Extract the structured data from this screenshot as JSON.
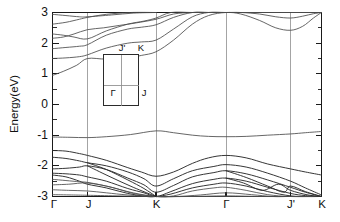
{
  "chart_data": {
    "type": "line",
    "title": "",
    "xlabel": "",
    "ylabel": "Energy(eV)",
    "ylim": [
      -3,
      3
    ],
    "grid": false,
    "legend": "none",
    "y_ticks": [
      3,
      2,
      1,
      0,
      -1,
      -2,
      -3
    ],
    "y_tick_labels": [
      "3",
      "2",
      "1",
      "0",
      "-1",
      "-2",
      "-3"
    ],
    "y_minor_step": 0.5,
    "x_tick_labels": [
      "Γ",
      "J",
      "K",
      "Γ",
      "J'",
      "K"
    ],
    "x_tick_positions": [
      0.0,
      0.13,
      0.385,
      0.645,
      0.885,
      1.0
    ],
    "high_symmetry_lines": [
      0.13,
      0.385,
      0.645,
      0.885
    ],
    "path_description": "Γ - J - K - Γ - J' - K",
    "series": [
      {
        "name": "conduction-band-1",
        "x": [
          0.0,
          0.04,
          0.09,
          0.13,
          0.2,
          0.28,
          0.33,
          0.385,
          0.45,
          0.52,
          0.58,
          0.645,
          0.7,
          0.77,
          0.83,
          0.885,
          0.93,
          0.97,
          1.0
        ],
        "y": [
          0.95,
          1.08,
          1.28,
          1.5,
          1.48,
          1.52,
          1.6,
          1.72,
          2.1,
          2.62,
          2.9,
          3.0,
          2.95,
          2.74,
          2.5,
          2.42,
          2.55,
          2.82,
          3.0
        ]
      },
      {
        "name": "conduction-band-2",
        "x": [
          0.0,
          0.05,
          0.1,
          0.13,
          0.2,
          0.28,
          0.33,
          0.385,
          0.45,
          0.52,
          0.58,
          0.645,
          0.7,
          0.77,
          0.83,
          0.885,
          0.93,
          0.97,
          1.0
        ],
        "y": [
          1.5,
          1.52,
          1.56,
          1.62,
          1.84,
          2.0,
          2.04,
          2.1,
          2.46,
          2.86,
          3.0,
          3.0,
          3.0,
          2.95,
          2.86,
          2.82,
          2.88,
          2.96,
          3.0
        ]
      },
      {
        "name": "conduction-band-3",
        "x": [
          0.0,
          0.05,
          0.1,
          0.13,
          0.2,
          0.28,
          0.33,
          0.385,
          0.45,
          0.52,
          0.58,
          0.645,
          0.72,
          0.8,
          0.885,
          0.94,
          1.0
        ],
        "y": [
          1.82,
          1.86,
          1.9,
          1.95,
          2.26,
          2.46,
          2.52,
          2.6,
          2.84,
          3.0,
          3.0,
          3.0,
          3.0,
          3.0,
          3.0,
          3.0,
          3.0
        ]
      },
      {
        "name": "conduction-band-4",
        "x": [
          0.0,
          0.04,
          0.08,
          0.13,
          0.19,
          0.25,
          0.31,
          0.385,
          0.45,
          0.52,
          0.6,
          0.645,
          0.72,
          0.8,
          0.885,
          0.94,
          1.0
        ],
        "y": [
          2.16,
          2.2,
          2.3,
          2.44,
          2.5,
          2.58,
          2.66,
          2.78,
          2.95,
          3.0,
          3.0,
          3.0,
          3.0,
          3.0,
          3.0,
          3.0,
          3.0
        ]
      },
      {
        "name": "conduction-band-5",
        "x": [
          0.0,
          0.04,
          0.08,
          0.13,
          0.2,
          0.28,
          0.34,
          0.385,
          0.44,
          0.52,
          0.6,
          0.645,
          0.73,
          0.81,
          0.885,
          0.95,
          1.0
        ],
        "y": [
          2.3,
          2.26,
          2.2,
          2.14,
          2.4,
          2.62,
          2.72,
          2.82,
          3.0,
          3.0,
          3.0,
          3.0,
          3.0,
          3.0,
          3.0,
          3.0,
          3.0
        ]
      },
      {
        "name": "conduction-band-6",
        "x": [
          0.0,
          0.05,
          0.1,
          0.13,
          0.2,
          0.29,
          0.385
        ],
        "y": [
          2.62,
          2.68,
          2.78,
          2.84,
          2.94,
          3.0,
          3.0
        ]
      },
      {
        "name": "conduction-band-7",
        "x": [
          0.0,
          0.05,
          0.1,
          0.13,
          0.22,
          0.3,
          0.385
        ],
        "y": [
          2.94,
          2.9,
          2.86,
          2.86,
          2.92,
          2.98,
          3.0
        ]
      },
      {
        "name": "flat-band-upper",
        "x": [
          0.0,
          0.065,
          0.13,
          0.2,
          0.29,
          0.385,
          0.45,
          0.52,
          0.58,
          0.645,
          0.72,
          0.8,
          0.885,
          0.94,
          1.0
        ],
        "y": [
          -1.06,
          -1.07,
          -1.08,
          -1.05,
          -0.98,
          -0.86,
          -0.92,
          -1.0,
          -1.04,
          -1.05,
          -1.04,
          -1.0,
          -0.96,
          -0.92,
          -0.88
        ]
      },
      {
        "name": "valence-band-1",
        "x": [
          0.0,
          0.05,
          0.1,
          0.13,
          0.2,
          0.28,
          0.33,
          0.385,
          0.45,
          0.52,
          0.58,
          0.645,
          0.72,
          0.8,
          0.885,
          0.94,
          1.0
        ],
        "y": [
          -1.5,
          -1.52,
          -1.6,
          -1.66,
          -1.82,
          -2.06,
          -2.2,
          -2.34,
          -2.2,
          -1.92,
          -1.74,
          -1.66,
          -1.74,
          -1.94,
          -2.1,
          -2.2,
          -2.3
        ]
      },
      {
        "name": "valence-band-2",
        "x": [
          0.0,
          0.05,
          0.1,
          0.13,
          0.2,
          0.28,
          0.34,
          0.385,
          0.45,
          0.52,
          0.6,
          0.645,
          0.72,
          0.8,
          0.885,
          0.94,
          1.0
        ],
        "y": [
          -1.72,
          -1.76,
          -1.84,
          -1.9,
          -2.0,
          -2.2,
          -2.42,
          -2.66,
          -2.42,
          -2.16,
          -2.02,
          -1.96,
          -2.04,
          -2.24,
          -2.5,
          -2.72,
          -2.95
        ]
      },
      {
        "name": "valence-band-3",
        "x": [
          0.0,
          0.05,
          0.1,
          0.13,
          0.2,
          0.28,
          0.34,
          0.385,
          0.45,
          0.52,
          0.6,
          0.645,
          0.72,
          0.8,
          0.885,
          0.94,
          1.0
        ],
        "y": [
          -2.1,
          -2.08,
          -2.04,
          -2.0,
          -2.12,
          -2.4,
          -2.62,
          -2.86,
          -2.64,
          -2.36,
          -2.22,
          -2.16,
          -2.26,
          -2.46,
          -2.7,
          -2.86,
          -3.0
        ]
      },
      {
        "name": "valence-band-4",
        "x": [
          0.0,
          0.05,
          0.1,
          0.13,
          0.2,
          0.28,
          0.34,
          0.385,
          0.44,
          0.52,
          0.6,
          0.645,
          0.72,
          0.8,
          0.885,
          0.94,
          1.0
        ],
        "y": [
          -2.24,
          -2.26,
          -2.3,
          -2.36,
          -2.5,
          -2.74,
          -2.88,
          -3.0,
          -2.84,
          -2.58,
          -2.44,
          -2.4,
          -2.5,
          -2.7,
          -2.9,
          -2.97,
          -3.0
        ]
      },
      {
        "name": "valence-band-5",
        "x": [
          0.0,
          0.05,
          0.1,
          0.13,
          0.2,
          0.28,
          0.35,
          0.385,
          0.44,
          0.52,
          0.6,
          0.645,
          0.72,
          0.8,
          0.885,
          0.95,
          1.0
        ],
        "y": [
          -2.3,
          -2.36,
          -2.5,
          -2.6,
          -2.72,
          -2.9,
          -3.0,
          -3.0,
          -2.92,
          -2.72,
          -2.6,
          -2.56,
          -2.66,
          -2.84,
          -2.98,
          -3.0,
          -3.0
        ]
      },
      {
        "name": "valence-band-6",
        "x": [
          0.0,
          0.05,
          0.1,
          0.13,
          0.2,
          0.3,
          0.385,
          0.45,
          0.52,
          0.6,
          0.645,
          0.72,
          0.8,
          0.885,
          1.0
        ],
        "y": [
          -2.44,
          -2.48,
          -2.52,
          -2.54,
          -2.66,
          -2.88,
          -3.0,
          -2.98,
          -2.82,
          -2.72,
          -2.7,
          -2.8,
          -2.94,
          -3.0,
          -3.0
        ]
      },
      {
        "name": "valence-band-7",
        "x": [
          0.0,
          0.06,
          0.13,
          0.22,
          0.3,
          0.385,
          0.46,
          0.55,
          0.645,
          0.74,
          0.82,
          0.885,
          1.0
        ],
        "y": [
          -2.62,
          -2.6,
          -2.56,
          -2.7,
          -2.9,
          -3.0,
          -3.0,
          -2.95,
          -2.88,
          -2.94,
          -3.0,
          -3.0,
          -3.0
        ]
      },
      {
        "name": "valence-band-8",
        "x": [
          0.0,
          0.06,
          0.13,
          0.2,
          0.28,
          0.385,
          0.5,
          0.645,
          0.78,
          0.885,
          1.0
        ],
        "y": [
          -2.78,
          -2.8,
          -2.82,
          -2.88,
          -2.95,
          -3.0,
          -3.0,
          -2.98,
          -3.0,
          -3.0,
          -3.0
        ]
      },
      {
        "name": "valence-band-9",
        "x": [
          0.0,
          0.07,
          0.13,
          0.24,
          0.385,
          0.5,
          0.645,
          0.8,
          0.885,
          1.0
        ],
        "y": [
          -2.94,
          -2.95,
          -2.96,
          -2.98,
          -3.0,
          -3.0,
          -3.0,
          -3.0,
          -3.0,
          -3.0
        ]
      },
      {
        "name": "valence-crossing-a",
        "x": [
          0.13,
          0.2,
          0.28,
          0.34,
          0.385
        ],
        "y": [
          -1.9,
          -2.12,
          -2.46,
          -2.74,
          -3.0
        ]
      },
      {
        "name": "valence-crossing-b",
        "x": [
          0.13,
          0.21,
          0.3,
          0.385
        ],
        "y": [
          -2.0,
          -2.34,
          -2.7,
          -3.0
        ]
      },
      {
        "name": "valence-crossing-c",
        "x": [
          0.645,
          0.72,
          0.8,
          0.86,
          0.885,
          0.94,
          1.0
        ],
        "y": [
          -2.16,
          -2.38,
          -2.66,
          -2.86,
          -2.66,
          -2.84,
          -3.0
        ]
      },
      {
        "name": "valence-crossing-d",
        "x": [
          0.645,
          0.71,
          0.78,
          0.84,
          0.885,
          0.95,
          1.0
        ],
        "y": [
          -2.4,
          -2.56,
          -2.8,
          -2.6,
          -2.8,
          -2.95,
          -3.0
        ]
      }
    ]
  },
  "inset": {
    "name": "brillouin-zone",
    "labels": {
      "gamma": "Γ",
      "j_prime": "J'",
      "k": "K",
      "j": "J"
    }
  }
}
